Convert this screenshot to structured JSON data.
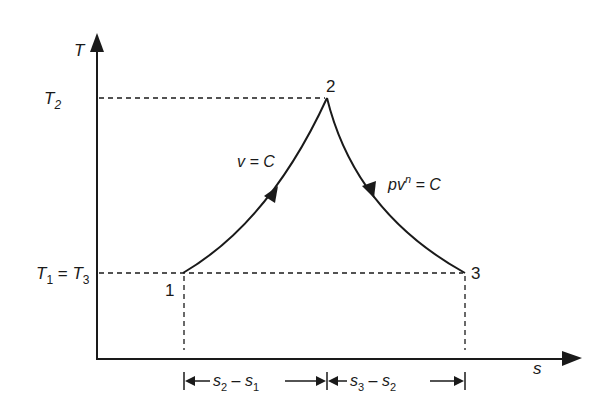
{
  "diagram": {
    "type": "T-s diagram",
    "axes": {
      "y_label": "T",
      "x_label": "s"
    },
    "y_ticks": [
      {
        "id": "t2",
        "main": "T",
        "sub": "2"
      },
      {
        "id": "t13",
        "main1": "T",
        "sub1": "1",
        "eq": " = ",
        "main2": "T",
        "sub2": "3"
      }
    ],
    "points": [
      {
        "id": "1",
        "label": "1"
      },
      {
        "id": "2",
        "label": "2"
      },
      {
        "id": "3",
        "label": "3"
      }
    ],
    "processes": [
      {
        "from": "1",
        "to": "2",
        "label_pre": "v = C"
      },
      {
        "from": "2",
        "to": "3",
        "label_p": "pv",
        "label_sup": "n",
        "label_post": " = C"
      }
    ],
    "dimensions": [
      {
        "a": "s",
        "a_sub": "2",
        "op": " – ",
        "b": "s",
        "b_sub": "1"
      },
      {
        "a": "s",
        "a_sub": "3",
        "op": " – ",
        "b": "s",
        "b_sub": "2"
      }
    ],
    "colors": {
      "line": "#1a1a1a",
      "background": "#ffffff"
    }
  }
}
